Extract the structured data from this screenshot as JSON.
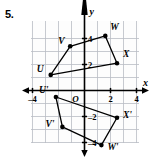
{
  "problem": {
    "number": "5."
  },
  "chart_data": {
    "type": "scatter",
    "title": "",
    "xlabel": "x",
    "ylabel": "y",
    "xlim": [
      -5,
      5
    ],
    "ylim": [
      -5,
      5
    ],
    "grid": true,
    "origin_label": "O",
    "xticks": [
      {
        "value": -4,
        "label": "-4"
      },
      {
        "value": 2,
        "label": "2"
      },
      {
        "value": 4,
        "label": "4"
      }
    ],
    "yticks": [
      {
        "value": 4,
        "label": "4"
      },
      {
        "value": 2,
        "label": "2"
      },
      {
        "value": -2,
        "label": "-2"
      },
      {
        "value": -4,
        "label": "-4"
      }
    ],
    "series": [
      {
        "name": "UVWX",
        "closed": true,
        "points": [
          {
            "label": "U",
            "x": -2.6,
            "y": 1.2,
            "label_dx": -14,
            "label_dy": -3
          },
          {
            "label": "V",
            "x": -1.1,
            "y": 3.4,
            "label_dx": -12,
            "label_dy": -2
          },
          {
            "label": "W",
            "x": 1.6,
            "y": 4.2,
            "label_dx": 5,
            "label_dy": -6
          },
          {
            "label": "X",
            "x": 2.5,
            "y": 2.1,
            "label_dx": 6,
            "label_dy": -6
          }
        ]
      },
      {
        "name": "U'V'W'X'",
        "closed": true,
        "points": [
          {
            "label": "U'",
            "x": -2.2,
            "y": -0.5,
            "label_dx": -17,
            "label_dy": -4
          },
          {
            "label": "V'",
            "x": -1.7,
            "y": -2.8,
            "label_dx": -17,
            "label_dy": 0
          },
          {
            "label": "W'",
            "x": 1.3,
            "y": -4.2,
            "label_dx": 6,
            "label_dy": 5
          },
          {
            "label": "X'",
            "x": 2.5,
            "y": -2.1,
            "label_dx": 6,
            "label_dy": 0
          }
        ]
      }
    ]
  },
  "colors": {
    "axis": "#000000",
    "grid": "#b9bdc4",
    "point": "#000000",
    "polygon": "#000000",
    "plot_background": "#fdfdfd"
  }
}
